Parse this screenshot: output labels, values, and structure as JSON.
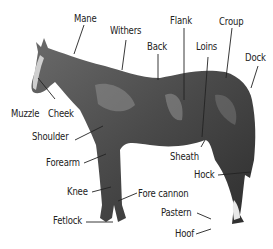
{
  "diagram": {
    "labels": {
      "mane": "Mane",
      "withers": "Withers",
      "flank": "Flank",
      "croup": "Croup",
      "back": "Back",
      "loins": "Loins",
      "dock": "Dock",
      "muzzle": "Muzzle",
      "cheek": "Cheek",
      "shoulder": "Shoulder",
      "sheath": "Sheath",
      "forearm": "Forearm",
      "hock": "Hock",
      "knee": "Knee",
      "fore_cannon": "Fore cannon",
      "pastern": "Pastern",
      "fetlock": "Fetlock",
      "hoof": "Hoof"
    }
  }
}
